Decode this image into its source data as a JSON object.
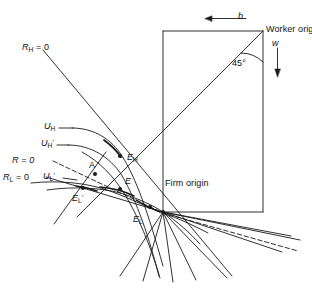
{
  "figure": {
    "type": "economics-diagram",
    "background_color": "#ffffff",
    "line_color": "#1a1a1a"
  },
  "labels": {
    "worker_origin": "Worker origin",
    "firm_origin": "Firm origin",
    "angle_45": "45°",
    "axis_b": "b",
    "axis_w": "w",
    "r_h_zero": "R",
    "r_h_zero_sub": "H",
    "r_h_zero_eq": " = 0",
    "r_zero": "R = 0",
    "r_l_zero": "R",
    "r_l_zero_sub": "L",
    "r_l_zero_eq": " = 0",
    "u_h": "U",
    "u_h_sub": "H",
    "u_h_prime": "U",
    "u_h_prime_sub": "H",
    "u_h_prime_mark": "'",
    "u_l_prime": "U",
    "u_l_prime_sub": "L",
    "u_l_prime_mark": "'",
    "point_a": "A",
    "point_e": "E",
    "point_e_h": "E",
    "point_e_h_sub": "H",
    "point_e_l": "E",
    "point_e_l_sub": "L",
    "point_e_l_prime": "E",
    "point_e_l_prime_sub": "L",
    "point_e_l_prime_mark": "'"
  },
  "geometry": {
    "box": {
      "left": 163,
      "top": 31,
      "right": 263,
      "bottom": 212
    },
    "worker_origin_point": {
      "x": 263,
      "y": 31
    },
    "firm_origin_point": {
      "x": 163,
      "y": 212
    },
    "b_arrow": {
      "x1": 245,
      "y1": 18,
      "x2": 206,
      "y2": 18,
      "direction": "left"
    },
    "w_arrow": {
      "x1": 277,
      "y1": 48,
      "x2": 277,
      "y2": 76,
      "direction": "down"
    },
    "diagonal_45": {
      "x1": 263,
      "y1": 31,
      "x2": 77,
      "y2": 217
    },
    "points": {
      "E_H": {
        "x": 120,
        "y": 156
      },
      "E": {
        "x": 120,
        "y": 186
      },
      "E_L": {
        "x": 150,
        "y": 212
      },
      "A": {
        "x": 95,
        "y": 173
      },
      "E_L_prime": {
        "x": 83,
        "y": 188
      }
    }
  }
}
